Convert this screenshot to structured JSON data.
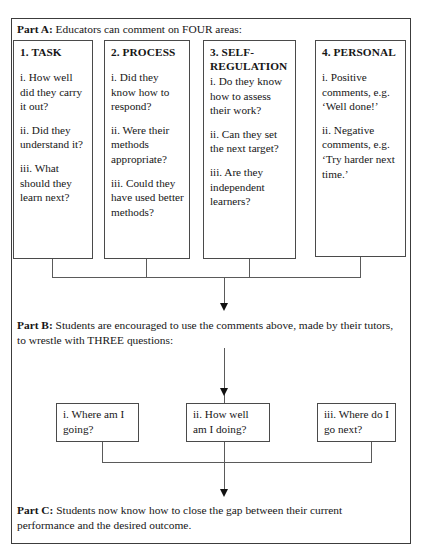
{
  "diagram": {
    "part_a": {
      "heading_label": "Part A:",
      "heading_text": " Educators can comment on FOUR areas:",
      "boxes": [
        {
          "title": "1. TASK",
          "items": [
            "i. How well did they carry it out?",
            "ii. Did they understand it?",
            "iii. What should they learn next?"
          ]
        },
        {
          "title": "2. PROCESS",
          "items": [
            "i. Did they know how to respond?",
            "ii. Were their methods appropriate?",
            "iii. Could they have used better methods?"
          ]
        },
        {
          "title": "3. SELF-REGULATION",
          "items": [
            "i. Do they know how to assess their work?",
            "ii. Can they set the next target?",
            "iii. Are they independent learners?"
          ]
        },
        {
          "title": "4. PERSONAL",
          "items": [
            "i. Positive comments, e.g. ‘Well done!’",
            "ii. Negative comments, e.g. ‘Try harder next time.’"
          ]
        }
      ]
    },
    "part_b": {
      "heading_label": "Part B:",
      "heading_text": " Students are encouraged to use the comments above, made by their tutors, to wrestle with THREE questions:",
      "questions": [
        "i. Where am I going?",
        "ii. How well am I doing?",
        "iii. Where do I go next?"
      ]
    },
    "part_c": {
      "heading_label": "Part C:",
      "heading_text": " Students now know how to close the gap between their current performance and the desired outcome."
    },
    "colors": {
      "frame": "#3c3c3c",
      "box_border": "#4a4a4a",
      "connector": "#5a5a5a",
      "arrowhead": "#111111",
      "text": "#161616",
      "background": "#ffffff"
    }
  }
}
